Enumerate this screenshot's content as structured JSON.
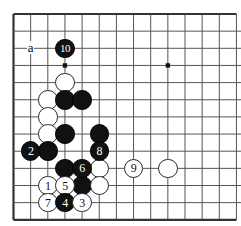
{
  "figure": {
    "type": "go-board-diagram",
    "board_width_px": 241,
    "board_height_px": 226,
    "grid_spacing_px": 17.15,
    "origin_x_px": 13.5,
    "origin_y_px": 14,
    "columns": 14,
    "rows": 13,
    "edges": {
      "left": true,
      "top": true,
      "bottom": true,
      "right": false
    },
    "line_color": "#555555",
    "edge_color": "#333333",
    "background_color": "#ffffff",
    "black_color": "#111111",
    "white_color": "#ffffff",
    "white_outline_color": "#2a2a2a"
  },
  "star_points": [
    {
      "col": 3,
      "row": 3
    },
    {
      "col": 9,
      "row": 3
    }
  ],
  "labels": [
    {
      "name": "point-a-label",
      "text": "a",
      "col": 1,
      "row": 2
    }
  ],
  "stones": [
    {
      "name": "stone-move-10",
      "color": "black",
      "label": "10",
      "col": 3,
      "row": 2
    },
    {
      "name": "stone-white-plain-1",
      "color": "white",
      "label": "",
      "col": 3,
      "row": 4
    },
    {
      "name": "stone-white-plain-2",
      "color": "white",
      "label": "",
      "col": 2,
      "row": 5
    },
    {
      "name": "stone-black-plain-1",
      "color": "black",
      "label": "",
      "col": 3,
      "row": 5
    },
    {
      "name": "stone-black-plain-2",
      "color": "black",
      "label": "",
      "col": 4,
      "row": 5
    },
    {
      "name": "stone-white-plain-3",
      "color": "white",
      "label": "",
      "col": 2,
      "row": 6
    },
    {
      "name": "stone-white-plain-4",
      "color": "white",
      "label": "",
      "col": 2,
      "row": 7
    },
    {
      "name": "stone-black-plain-3",
      "color": "black",
      "label": "",
      "col": 3,
      "row": 7
    },
    {
      "name": "stone-black-plain-4",
      "color": "black",
      "label": "",
      "col": 5,
      "row": 7
    },
    {
      "name": "stone-move-2",
      "color": "black",
      "label": "2",
      "col": 1,
      "row": 8
    },
    {
      "name": "stone-black-plain-5",
      "color": "black",
      "label": "",
      "col": 2,
      "row": 8
    },
    {
      "name": "stone-move-8",
      "color": "black",
      "label": "8",
      "col": 5,
      "row": 8
    },
    {
      "name": "stone-black-plain-6",
      "color": "black",
      "label": "",
      "col": 3,
      "row": 9
    },
    {
      "name": "stone-move-6",
      "color": "black",
      "label": "6",
      "col": 4,
      "row": 9
    },
    {
      "name": "stone-white-plain-5",
      "color": "white",
      "label": "",
      "col": 5,
      "row": 9
    },
    {
      "name": "stone-move-9",
      "color": "white",
      "label": "9",
      "col": 7,
      "row": 9
    },
    {
      "name": "stone-white-plain-6",
      "color": "white",
      "label": "",
      "col": 9,
      "row": 9
    },
    {
      "name": "stone-move-1",
      "color": "white",
      "label": "1",
      "col": 2,
      "row": 10
    },
    {
      "name": "stone-move-5",
      "color": "white",
      "label": "5",
      "col": 3,
      "row": 10
    },
    {
      "name": "stone-black-plain-7",
      "color": "black",
      "label": "",
      "col": 4,
      "row": 10
    },
    {
      "name": "stone-white-plain-7",
      "color": "white",
      "label": "",
      "col": 5,
      "row": 10
    },
    {
      "name": "stone-move-7",
      "color": "white",
      "label": "7",
      "col": 2,
      "row": 11
    },
    {
      "name": "stone-move-4",
      "color": "black",
      "label": "4",
      "col": 3,
      "row": 11
    },
    {
      "name": "stone-move-3",
      "color": "white",
      "label": "3",
      "col": 4,
      "row": 11
    }
  ]
}
